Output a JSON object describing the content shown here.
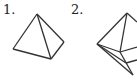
{
  "figures": [
    {
      "label": "1.",
      "shape": "tetrahedron (triangular pyramid)"
    },
    {
      "label": "2.",
      "shape": "octahedron-like polyhedron (partially cropped)"
    }
  ],
  "colors": {
    "stroke": "#333333",
    "background": "#ffffff"
  }
}
